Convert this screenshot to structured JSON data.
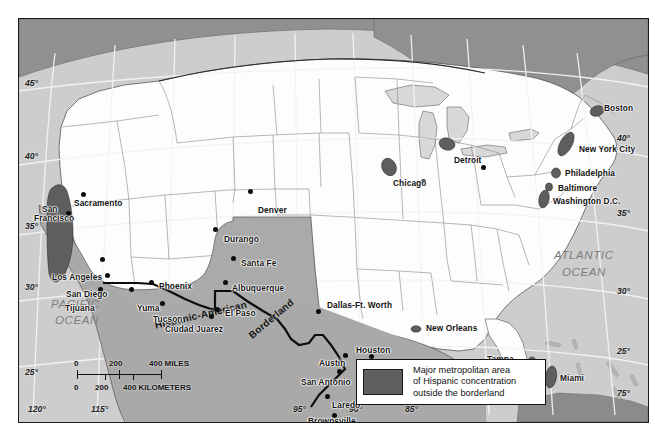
{
  "map": {
    "title": "Hispanic-American Borderland",
    "projection_note": "conic with curved graticule",
    "colors": {
      "ocean": "#cdcdcd",
      "land_us": "#fdfdfd",
      "canada": "#909090",
      "mexico": "#a9a9a9",
      "borderland": "#a9a9a9",
      "metro_hispanic": "#5e5e5e",
      "great_lakes": "#d8d8d8",
      "graticule": "#f2f2f2",
      "border_line": "#111111",
      "state_line": "#8b8b8b"
    },
    "oceans": [
      {
        "name": "PACIFIC OCEAN",
        "line1": "PACIFIC",
        "line2": "OCEAN"
      },
      {
        "name": "ATLANTIC OCEAN",
        "line1": "ATLANTIC",
        "line2": "OCEAN"
      }
    ],
    "region_labels": [
      {
        "name": "hispanic-american",
        "text": "Hispanic-American"
      },
      {
        "name": "borderland",
        "text": "Borderland"
      }
    ],
    "graticule_left": [
      {
        "label": "45°",
        "value": 45
      },
      {
        "label": "40°",
        "value": 40
      },
      {
        "label": "35°",
        "value": 35
      },
      {
        "label": "30°",
        "value": 30
      },
      {
        "label": "25°",
        "value": 25
      }
    ],
    "graticule_right": [
      {
        "label": "40°",
        "value": 40
      },
      {
        "label": "35°",
        "value": 35
      },
      {
        "label": "30°",
        "value": 30
      },
      {
        "label": "25°",
        "value": 25
      },
      {
        "label": "75°",
        "value": 75
      }
    ],
    "graticule_bottom": [
      {
        "label": "120°",
        "value": 120
      },
      {
        "label": "115°",
        "value": 115
      },
      {
        "label": "95°",
        "value": 95
      },
      {
        "label": "90°",
        "value": 90
      },
      {
        "label": "85°",
        "value": 85
      }
    ],
    "cities": [
      {
        "name": "Sacramento",
        "label": "Sacramento"
      },
      {
        "name": "San Francisco",
        "label": "San\nFrancisco"
      },
      {
        "name": "Los Angeles",
        "label": "Los Angeles"
      },
      {
        "name": "San Diego",
        "label": "San Diego"
      },
      {
        "name": "Tijuana",
        "label": "Tijuana"
      },
      {
        "name": "Yuma",
        "label": "Yuma"
      },
      {
        "name": "Phoenix",
        "label": "Phoenix"
      },
      {
        "name": "Tucson",
        "label": "Tucson"
      },
      {
        "name": "Durango",
        "label": "Durango"
      },
      {
        "name": "Santa Fe",
        "label": "Santa Fe"
      },
      {
        "name": "Albuquerque",
        "label": "Albuquerque"
      },
      {
        "name": "Denver",
        "label": "Denver"
      },
      {
        "name": "El Paso",
        "label": "El Paso"
      },
      {
        "name": "Ciudad Juarez",
        "label": "Ciudad Juarez"
      },
      {
        "name": "Dallas-Ft. Worth",
        "label": "Dallas-Ft. Worth"
      },
      {
        "name": "Austin",
        "label": "Austin"
      },
      {
        "name": "Houston",
        "label": "Houston"
      },
      {
        "name": "Galveston",
        "label": "Galveston"
      },
      {
        "name": "San Antonio",
        "label": "San Antonio"
      },
      {
        "name": "Laredo",
        "label": "Laredo"
      },
      {
        "name": "Brownsville",
        "label": "Brownsville"
      },
      {
        "name": "New Orleans",
        "label": "New Orleans"
      },
      {
        "name": "Tampa-St. Petersburg",
        "label": "Tampa-\nSt. Petersburg"
      },
      {
        "name": "Miami",
        "label": "Miami"
      },
      {
        "name": "Chicago",
        "label": "Chicago"
      },
      {
        "name": "Detroit",
        "label": "Detroit"
      },
      {
        "name": "Boston",
        "label": "Boston"
      },
      {
        "name": "New York City",
        "label": "New York City"
      },
      {
        "name": "Philadelphia",
        "label": "Philadelphia"
      },
      {
        "name": "Baltimore",
        "label": "Baltimore"
      },
      {
        "name": "Washington D.C.",
        "label": "Washington D.C."
      }
    ],
    "scale": {
      "miles": {
        "zero": "0",
        "mid": "200",
        "max": "400 MILES"
      },
      "kilometers": {
        "zero": "0",
        "mid": "200",
        "max": "400 KILOMETERS"
      }
    },
    "legend": {
      "swatch_color": "#5e5e5e",
      "line1": "Major metropolitan area",
      "line2": "of Hispanic concentration",
      "line3": "outside the borderland"
    }
  }
}
